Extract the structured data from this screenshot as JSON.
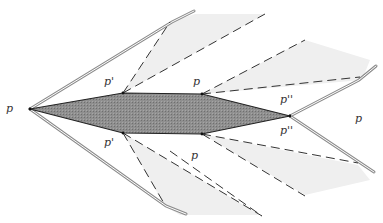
{
  "diagram": {
    "type": "geometric-figure",
    "labels": [
      {
        "id": "p-left",
        "text": "p",
        "x": 6,
        "y": 103
      },
      {
        "id": "p-prime-top",
        "text": "p'",
        "x": 104,
        "y": 76
      },
      {
        "id": "p-top-mid",
        "text": "p",
        "x": 193,
        "y": 76
      },
      {
        "id": "p-double-prime-top",
        "text": "p''",
        "x": 280,
        "y": 94
      },
      {
        "id": "p-right",
        "text": "p",
        "x": 355,
        "y": 113
      },
      {
        "id": "p-double-prime-bottom",
        "text": "p''",
        "x": 280,
        "y": 125
      },
      {
        "id": "p-prime-bottom",
        "text": "p'",
        "x": 104,
        "y": 137
      },
      {
        "id": "p-bottom-mid",
        "text": "p",
        "x": 191,
        "y": 150
      }
    ],
    "colors": {
      "central_fill": "#8a8a8a",
      "central_stroke": "#222222",
      "fan_fill": "#efefef",
      "dash_stroke": "#333333",
      "double_line": "#999999",
      "label": "#333333"
    }
  }
}
